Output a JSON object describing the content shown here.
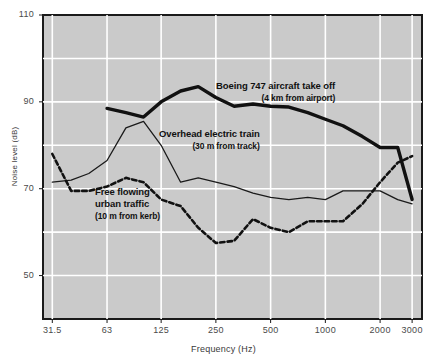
{
  "chart_data": {
    "type": "line",
    "title": "",
    "xlabel": "Frequency (Hz)",
    "ylabel": "Noise level (dB)",
    "xscale": "log",
    "xlim": [
      28,
      3400
    ],
    "ylim": [
      40,
      110
    ],
    "grid": true,
    "y_ticks": [
      50,
      70,
      90,
      110
    ],
    "y_gridlines": [
      40,
      50,
      60,
      70,
      80,
      90,
      100,
      110
    ],
    "x_ticks": [
      31.5,
      63,
      125,
      250,
      500,
      1000,
      2000,
      3000
    ],
    "x_tick_labels": [
      "31.5",
      "63",
      "125",
      "250",
      "500",
      "1000",
      "2000",
      "3000"
    ],
    "legend_position": "inline-annotations",
    "x": [
      31.5,
      40,
      50,
      63,
      80,
      100,
      125,
      160,
      200,
      250,
      315,
      400,
      500,
      630,
      800,
      1000,
      1250,
      1600,
      2000,
      2500,
      3000
    ],
    "series": [
      {
        "name": "Boeing 747 aircraft take off",
        "sublabel": "(4 km from airport)",
        "style": "thick-solid",
        "color": "#111111",
        "x": [
          63,
          80,
          100,
          125,
          160,
          200,
          250,
          315,
          400,
          500,
          630,
          800,
          1000,
          1250,
          1600,
          2000,
          2500,
          3000
        ],
        "values": [
          88.5,
          87.5,
          86.5,
          90.0,
          92.5,
          93.5,
          91.0,
          89.0,
          89.5,
          89.0,
          88.8,
          87.5,
          86.0,
          84.5,
          82.0,
          79.5,
          79.5,
          67.5
        ]
      },
      {
        "name": "Overhead electric train",
        "sublabel": "(30 m from track)",
        "style": "thin-solid",
        "color": "#1a1a1a",
        "x": [
          31.5,
          40,
          50,
          63,
          80,
          100,
          125,
          160,
          200,
          250,
          315,
          400,
          500,
          630,
          800,
          1000,
          1250,
          1600,
          2000,
          2500,
          3000
        ],
        "values": [
          71.5,
          72.0,
          73.5,
          76.5,
          84.0,
          85.5,
          80.0,
          71.5,
          72.5,
          71.5,
          70.5,
          69.0,
          68.0,
          67.5,
          68.0,
          67.5,
          69.5,
          69.5,
          69.5,
          67.5,
          66.5
        ]
      },
      {
        "name": "Free flowing urban traffic",
        "sublabel": "(10 m from kerb)",
        "style": "dashed",
        "color": "#111111",
        "x": [
          31.5,
          40,
          50,
          63,
          80,
          100,
          125,
          160,
          200,
          250,
          315,
          400,
          500,
          630,
          800,
          1000,
          1250,
          1600,
          2000,
          2500,
          3000
        ],
        "values": [
          78.0,
          69.5,
          69.5,
          70.5,
          72.5,
          71.5,
          67.5,
          66.0,
          61.0,
          57.5,
          58.0,
          63.0,
          61.0,
          60.0,
          62.5,
          62.5,
          62.5,
          66.5,
          71.5,
          76.0,
          77.5
        ]
      }
    ],
    "annotations": [
      {
        "id": "boeing",
        "label": "Boeing 747 aircraft take off",
        "sublabel": "(4 km from airport)"
      },
      {
        "id": "train",
        "label": "Overhead electric train",
        "sublabel": "(30 m from track)"
      },
      {
        "id": "traffic",
        "label": "Free flowing",
        "label2": "urban traffic",
        "sublabel": "(10 m from kerb)"
      }
    ],
    "colors": {
      "plot_background": "#cacaca",
      "gridline": "#ffffff",
      "axis": "#1a1a1a",
      "page_background": "#ffffff",
      "tick_label": "#4a4a4a"
    }
  }
}
